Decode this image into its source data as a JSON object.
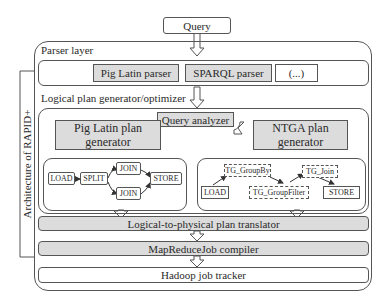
{
  "diagram": {
    "query": "Query",
    "side_label": "Architecture of RAPID+",
    "parser_layer": {
      "title": "Parser layer",
      "parsers": [
        "Pig Latin parser",
        "SPARQL parser",
        "(...)"
      ]
    },
    "logical_layer": {
      "title": "Logical plan generator/optimizer",
      "query_analyzer": "Query analyzer",
      "pig_generator": "Pig Latin plan generator",
      "ntga_generator": "NTGA plan generator",
      "pig_plan": {
        "nodes": [
          "LOAD",
          "SPLIT",
          "JOIN",
          "JOIN",
          "STORE"
        ]
      },
      "ntga_plan": {
        "nodes": [
          "TG_GroupBy",
          "TG_Join",
          "LOAD",
          "TG_GroupFilter",
          "STORE"
        ]
      }
    },
    "stages": [
      "Logical-to-physical plan translator",
      "MapReduceJob compiler",
      "Hadoop job tracker"
    ]
  }
}
